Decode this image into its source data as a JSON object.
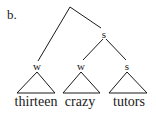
{
  "figure": {
    "label": "b.",
    "tree": {
      "root": {
        "label": "",
        "x": 70,
        "y": 7
      },
      "nodes": [
        {
          "id": "s_upper",
          "label": "s",
          "x": 104,
          "y": 33
        },
        {
          "id": "w_left",
          "label": "w",
          "x": 37,
          "y": 64
        },
        {
          "id": "w_mid",
          "label": "w",
          "x": 81,
          "y": 64
        },
        {
          "id": "s_right",
          "label": "s",
          "x": 127,
          "y": 64
        }
      ],
      "edges": [
        [
          "root",
          "w_left"
        ],
        [
          "root",
          "s_upper"
        ],
        [
          "s_upper",
          "w_mid"
        ],
        [
          "s_upper",
          "s_right"
        ]
      ],
      "leaves": [
        {
          "word": "thirteen",
          "under": "w_left"
        },
        {
          "word": "crazy",
          "under": "w_mid"
        },
        {
          "word": "tutors",
          "under": "s_right"
        }
      ]
    },
    "colors": {
      "ink": "#1a1a1a",
      "background": "#ffffff"
    }
  }
}
